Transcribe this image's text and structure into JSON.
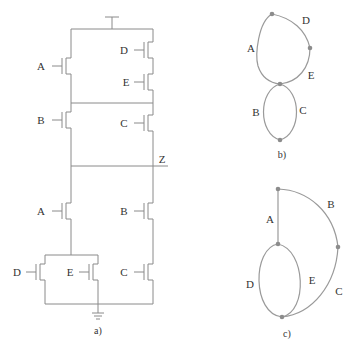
{
  "figure_a": {
    "caption": "a)",
    "output_label": "Z",
    "pull_up": {
      "left": [
        "A",
        "B"
      ],
      "right_series": [
        "D",
        "E"
      ],
      "right_lower": "C"
    },
    "pull_down": {
      "left_top": "A",
      "left_parallel": [
        "D",
        "E"
      ],
      "right": [
        "B",
        "C"
      ]
    }
  },
  "figure_b": {
    "caption": "b)",
    "edges": [
      "A",
      "D",
      "E",
      "B",
      "C"
    ]
  },
  "figure_c": {
    "caption": "c)",
    "edges": [
      "A",
      "B",
      "C",
      "D",
      "E"
    ]
  },
  "colors": {
    "wire": "#8a8a8a",
    "edge": "#9a9a9a",
    "node": "#8c8c8c",
    "text": "#333333"
  }
}
